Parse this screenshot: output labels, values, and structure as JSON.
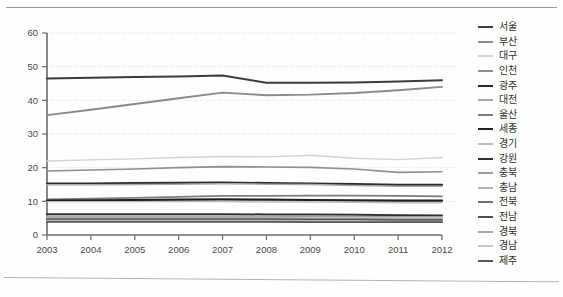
{
  "chart_data": {
    "type": "line",
    "title": "",
    "subtitle": "",
    "xlabel": "",
    "ylabel": "",
    "x": [
      2003,
      2004,
      2005,
      2006,
      2007,
      2008,
      2009,
      2010,
      2011,
      2012
    ],
    "xtick_labels": [
      "2003",
      "2004",
      "2005",
      "2006",
      "2007",
      "2008",
      "2009",
      "2010",
      "2011",
      "2012"
    ],
    "ytick_labels": [
      "0",
      "10",
      "20",
      "30",
      "40",
      "50",
      "60"
    ],
    "yticks": [
      0,
      10,
      20,
      30,
      40,
      50,
      60
    ],
    "ylim": [
      0,
      60
    ],
    "xlim": [
      2003,
      2012
    ],
    "grid": "horizontal-dotted",
    "legend_position": "right",
    "series": [
      {
        "name": "서울",
        "color": "#3d3d3d",
        "width": 2.0,
        "values": [
          46.5,
          46.7,
          46.9,
          47.1,
          47.4,
          45.2,
          45.2,
          45.3,
          45.6,
          46.0
        ]
      },
      {
        "name": "부산",
        "color": "#8a8a8a",
        "width": 1.9,
        "values": [
          35.6,
          37.2,
          38.9,
          40.6,
          42.3,
          41.5,
          41.7,
          42.2,
          43.0,
          44.0
        ]
      },
      {
        "name": "대구",
        "color": "#d2d2d2",
        "width": 1.4,
        "values": [
          22.0,
          22.3,
          22.6,
          23.0,
          23.3,
          23.2,
          23.7,
          22.8,
          22.4,
          23.0
        ]
      },
      {
        "name": "인천",
        "color": "#8f8f8f",
        "width": 1.6,
        "values": [
          19.0,
          19.3,
          19.6,
          20.0,
          20.3,
          20.2,
          20.1,
          19.6,
          18.6,
          18.8
        ]
      },
      {
        "name": "광주",
        "color": "#2b2b2b",
        "width": 2.2,
        "values": [
          15.3,
          15.3,
          15.4,
          15.5,
          15.6,
          15.4,
          15.3,
          15.1,
          14.9,
          14.9
        ]
      },
      {
        "name": "대전",
        "color": "#a8a8a8",
        "width": 1.5,
        "values": [
          14.9,
          14.9,
          15.0,
          15.1,
          15.2,
          15.1,
          15.0,
          14.7,
          14.5,
          14.5
        ]
      },
      {
        "name": "울산",
        "color": "#7d7d7d",
        "width": 1.7,
        "values": [
          10.6,
          10.8,
          11.0,
          11.3,
          11.6,
          11.6,
          11.7,
          11.7,
          11.6,
          11.5
        ]
      },
      {
        "name": "세종",
        "color": "#1f1f1f",
        "width": 2.2,
        "values": [
          10.2,
          10.3,
          10.4,
          10.5,
          10.6,
          10.5,
          10.4,
          10.3,
          10.2,
          10.2
        ]
      },
      {
        "name": "경기",
        "color": "#bcbcbc",
        "width": 1.4,
        "values": [
          9.9,
          9.9,
          9.9,
          9.9,
          9.9,
          9.8,
          9.8,
          9.7,
          9.6,
          9.6
        ]
      },
      {
        "name": "강원",
        "color": "#2f2f2f",
        "width": 2.0,
        "values": [
          6.2,
          6.2,
          6.2,
          6.2,
          6.2,
          6.1,
          6.1,
          6.0,
          5.9,
          5.8
        ]
      },
      {
        "name": "충북",
        "color": "#9e9e9e",
        "width": 1.5,
        "values": [
          5.6,
          5.6,
          5.6,
          5.6,
          5.6,
          5.6,
          5.5,
          5.5,
          5.4,
          5.4
        ]
      },
      {
        "name": "충남",
        "color": "#b5b5b5",
        "width": 1.4,
        "values": [
          5.2,
          5.2,
          5.2,
          5.2,
          5.2,
          5.2,
          5.1,
          5.1,
          5.0,
          5.0
        ]
      },
      {
        "name": "전북",
        "color": "#6e6e6e",
        "width": 1.7,
        "values": [
          4.8,
          4.8,
          4.8,
          4.8,
          4.8,
          4.8,
          4.7,
          4.7,
          4.6,
          4.6
        ]
      },
      {
        "name": "전남",
        "color": "#4f4f4f",
        "width": 1.8,
        "values": [
          4.5,
          4.5,
          4.5,
          4.5,
          4.5,
          4.5,
          4.4,
          4.4,
          4.3,
          4.3
        ]
      },
      {
        "name": "경북",
        "color": "#aaaaaa",
        "width": 1.5,
        "values": [
          4.3,
          4.3,
          4.3,
          4.3,
          4.3,
          4.3,
          4.2,
          4.2,
          4.1,
          4.1
        ]
      },
      {
        "name": "경남",
        "color": "#c8c8c8",
        "width": 1.4,
        "values": [
          4.1,
          4.1,
          4.1,
          4.1,
          4.1,
          4.1,
          4.0,
          4.0,
          3.9,
          3.9
        ]
      },
      {
        "name": "제주",
        "color": "#555555",
        "width": 1.8,
        "values": [
          3.9,
          3.9,
          3.9,
          3.9,
          3.9,
          3.9,
          3.8,
          3.8,
          3.8,
          3.8
        ]
      }
    ]
  }
}
